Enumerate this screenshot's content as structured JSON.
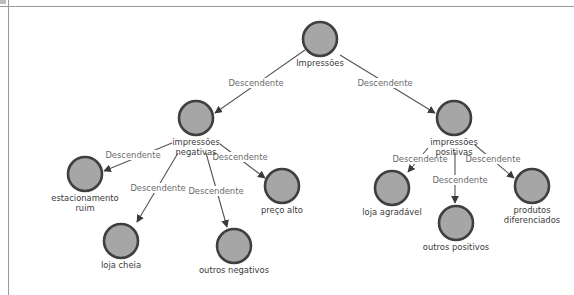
{
  "diagram": {
    "type": "tree",
    "nodes": [
      {
        "id": "root",
        "label_lines": [
          "Impressões"
        ],
        "x": 320,
        "y": 39
      },
      {
        "id": "neg",
        "label_lines": [
          "impressões",
          "negativas"
        ],
        "x": 196,
        "y": 118
      },
      {
        "id": "pos",
        "label_lines": [
          "impressões",
          "positivas"
        ],
        "x": 454,
        "y": 118
      },
      {
        "id": "est",
        "label_lines": [
          "estacionamento",
          "ruim"
        ],
        "x": 85,
        "y": 174
      },
      {
        "id": "cheia",
        "label_lines": [
          "loja cheia"
        ],
        "x": 121,
        "y": 241
      },
      {
        "id": "outneg",
        "label_lines": [
          "outros negativos"
        ],
        "x": 234,
        "y": 246
      },
      {
        "id": "preco",
        "label_lines": [
          "preço alto"
        ],
        "x": 282,
        "y": 186
      },
      {
        "id": "agrad",
        "label_lines": [
          "loja agradável"
        ],
        "x": 392,
        "y": 188
      },
      {
        "id": "outpos",
        "label_lines": [
          "outros positivos"
        ],
        "x": 456,
        "y": 223
      },
      {
        "id": "prod",
        "label_lines": [
          "produtos",
          "diferenciados"
        ],
        "x": 532,
        "y": 186
      }
    ],
    "edges": [
      {
        "from": "root",
        "to": "neg",
        "label": "Descendente",
        "x1": 305,
        "y1": 50,
        "x2": 215,
        "y2": 113,
        "lx": 256,
        "ly": 86
      },
      {
        "from": "root",
        "to": "pos",
        "label": "Descendente",
        "x1": 340,
        "y1": 55,
        "x2": 435,
        "y2": 113,
        "lx": 385,
        "ly": 86
      },
      {
        "from": "neg",
        "to": "est",
        "label": "Descendente",
        "x1": 172,
        "y1": 143,
        "x2": 104,
        "y2": 171,
        "lx": 133,
        "ly": 158
      },
      {
        "from": "neg",
        "to": "cheia",
        "label": "Descendente",
        "x1": 178,
        "y1": 153,
        "x2": 137,
        "y2": 222,
        "lx": 158,
        "ly": 191
      },
      {
        "from": "neg",
        "to": "outneg",
        "label": "Descendente",
        "x1": 206,
        "y1": 153,
        "x2": 227,
        "y2": 227,
        "lx": 216,
        "ly": 194
      },
      {
        "from": "neg",
        "to": "preco",
        "label": "Descendente",
        "x1": 220,
        "y1": 144,
        "x2": 265,
        "y2": 178,
        "lx": 240,
        "ly": 160
      },
      {
        "from": "pos",
        "to": "agrad",
        "label": "Descendente",
        "x1": 428,
        "y1": 148,
        "x2": 408,
        "y2": 172,
        "lx": 420,
        "ly": 162
      },
      {
        "from": "pos",
        "to": "outpos",
        "label": "Descendente",
        "x1": 455,
        "y1": 152,
        "x2": 455,
        "y2": 203,
        "lx": 460,
        "ly": 183
      },
      {
        "from": "pos",
        "to": "prod",
        "label": "Descendente",
        "x1": 475,
        "y1": 145,
        "x2": 514,
        "y2": 178,
        "lx": 493,
        "ly": 162
      }
    ]
  }
}
